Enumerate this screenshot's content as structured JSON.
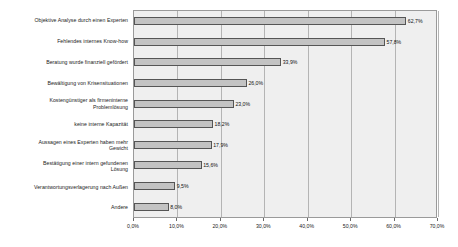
{
  "chart_data": {
    "type": "bar",
    "orientation": "horizontal",
    "title": "",
    "subtitle": "",
    "xlabel": "",
    "ylabel": "",
    "xlim": [
      0,
      70
    ],
    "grid": true,
    "legend": false,
    "value_suffix": "%",
    "decimal_separator": ",",
    "xticks": [
      "0,0%",
      "10,0%",
      "20,0%",
      "30,0%",
      "40,0%",
      "50,0%",
      "60,0%",
      "70,0%"
    ],
    "xtick_values": [
      0,
      10,
      20,
      30,
      40,
      50,
      60,
      70
    ],
    "categories": [
      "Objektive Analyse durch einen Experten",
      "Fehlendes internes Know-how",
      "Beratung wurde finanziell gefördert",
      "Bewältigung von Krisensituationen",
      "Kostengünstiger als firmeninterne\nProblemlösung",
      "keine interne Kapazität",
      "Aussagen eines Experten haben mehr\nGewicht",
      "Bestätigung einer intern gefundenen\nLösung",
      "Verantwortungsverlagerung nach Außen",
      "Andere"
    ],
    "values": [
      62.7,
      57.8,
      33.9,
      26.0,
      23.0,
      18.2,
      17.9,
      15.6,
      9.5,
      8.0
    ],
    "data_labels": [
      "62,7%",
      "57,8%",
      "33,9%",
      "26,0%",
      "23,0%",
      "18,2%",
      "17,9%",
      "15,6%",
      "9,5%",
      "8,0%"
    ],
    "colors": {
      "bar_fill": "#c3c3c3",
      "bar_border": "#555555",
      "plot_background": "#efefef",
      "plot_border": "#9a9a9a",
      "gridline": "#b4b4b4",
      "text": "#1a1a1a",
      "page_background": "#ffffff"
    }
  }
}
